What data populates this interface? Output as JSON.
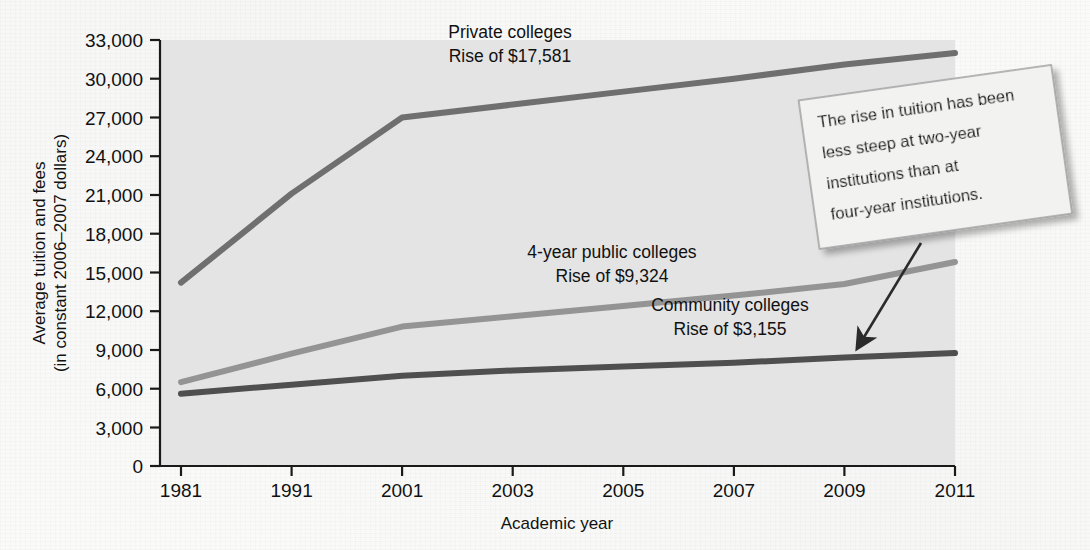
{
  "figure": {
    "background_color": "#fbfbfa",
    "plot_background_color": "#e4e4e4"
  },
  "callout": {
    "name": "annotation-callout",
    "lines": [
      "The rise in tuition has been",
      "less steep at two-year",
      "institutions than at",
      "four-year institutions."
    ],
    "fill": "#f2f2f1",
    "border": "#9a9a9a"
  },
  "chart_data": {
    "type": "line",
    "title": "",
    "subtitle": "",
    "xlabel": "Academic year",
    "ylabel": "Average tuition and fees\n(in constant 2006–2007 dollars)",
    "ylabel_line1": "Average tuition and fees",
    "ylabel_line2": "(in constant 2006–2007 dollars)",
    "x": [
      1981,
      1991,
      2001,
      2003,
      2005,
      2007,
      2009,
      2011
    ],
    "xticklabels": [
      "1981",
      "1991",
      "2001",
      "2003",
      "2005",
      "2007",
      "2009",
      "2011"
    ],
    "yticks": [
      0,
      3000,
      6000,
      9000,
      12000,
      15000,
      18000,
      21000,
      24000,
      27000,
      30000,
      33000
    ],
    "yticklabels": [
      "0",
      "3,000",
      "6,000",
      "9,000",
      "12,000",
      "15,000",
      "18,000",
      "21,000",
      "24,000",
      "27,000",
      "30,000",
      "33,000"
    ],
    "ylim": [
      0,
      33000
    ],
    "grid": false,
    "legend": "inline-labels",
    "series": [
      {
        "name": "Private colleges",
        "annotation_line1": "Private colleges",
        "annotation_line2": "Rise of $17,581",
        "rise": 17581,
        "color": "#6f6f6f",
        "values": [
          14200,
          21100,
          27000,
          28000,
          29000,
          30000,
          31100,
          32000
        ]
      },
      {
        "name": "4-year public colleges",
        "annotation_line1": "4-year public colleges",
        "annotation_line2": "Rise of $9,324",
        "rise": 9324,
        "color": "#949494",
        "values": [
          6500,
          8700,
          10800,
          11600,
          12400,
          13200,
          14100,
          15800
        ]
      },
      {
        "name": "Community colleges",
        "annotation_line1": "Community colleges",
        "annotation_line2": "Rise of $3,155",
        "rise": 3155,
        "color": "#4f4f4f",
        "values": [
          5600,
          6300,
          7000,
          7400,
          7700,
          8000,
          8400,
          8750
        ]
      }
    ]
  }
}
